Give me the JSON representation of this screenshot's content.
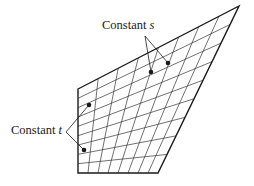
{
  "figure": {
    "type": "bilinear-patch-diagram",
    "labels": {
      "constant_s": {
        "text": "Constant ",
        "var": "s"
      },
      "constant_t": {
        "text": "Constant ",
        "var": "t"
      }
    },
    "quad": {
      "top_left": [
        78,
        89
      ],
      "top_right": [
        239,
        6
      ],
      "bottom_right": [
        158,
        173
      ],
      "bottom_left": [
        78,
        173
      ]
    },
    "grid": {
      "s_divisions": 8,
      "t_divisions": 9
    },
    "points": {
      "constant_s": [
        [
          151,
          72
        ],
        [
          168,
          63
        ]
      ],
      "constant_t": [
        [
          89,
          105
        ],
        [
          84,
          150
        ]
      ]
    },
    "leaders": {
      "constant_s": {
        "apex": [
          145,
          36
        ],
        "targets": [
          [
            151,
            72
          ],
          [
            168,
            63
          ]
        ]
      },
      "constant_t": {
        "apex": [
          66,
          132
        ],
        "targets": [
          [
            89,
            105
          ],
          [
            84,
            150
          ]
        ]
      }
    },
    "colors": {
      "line": "#1a1a1a",
      "grid": "#333333",
      "background": "#ffffff"
    }
  }
}
